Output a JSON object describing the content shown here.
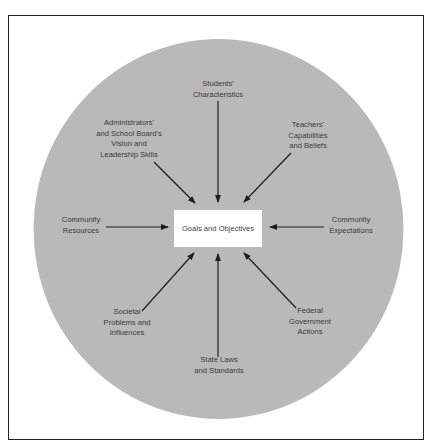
{
  "diagram": {
    "center": {
      "label": "Goals and Objectives"
    },
    "colors": {
      "circle_fill": "#b9b9b9",
      "box_fill": "#ffffff",
      "arrow": "#1e1e1e",
      "text": "#3a3a3a",
      "frame": "#222222"
    },
    "influences": [
      {
        "id": "students",
        "label": "Students'\nCharacteristics"
      },
      {
        "id": "teachers",
        "label": "Teachers'\nCapabilities\nand Beliefs"
      },
      {
        "id": "community-expectations",
        "label": "Community\nExpectations"
      },
      {
        "id": "federal",
        "label": "Federal\nGovernment\nActions"
      },
      {
        "id": "state",
        "label": "State Laws\nand Standards"
      },
      {
        "id": "societal",
        "label": "Societal\nProblems and\nInfluences"
      },
      {
        "id": "community-resources",
        "label": "Community\nResources"
      },
      {
        "id": "administrators",
        "label": "Administrators'\nand School Board's\nVision and\nLeadership Skills"
      }
    ]
  }
}
